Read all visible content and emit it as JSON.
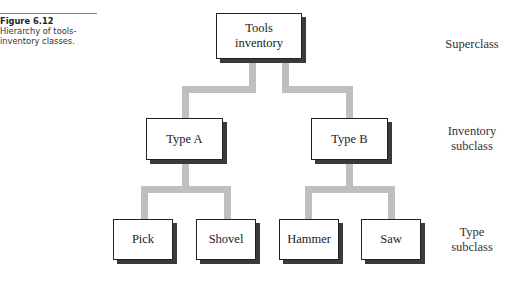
{
  "caption": {
    "figure_label": "Figure 6.12",
    "text_line1": "Hierarchy of tools-",
    "text_line2": "inventory classes."
  },
  "nodes": {
    "root": {
      "label_line1": "Tools",
      "label_line2": "inventory"
    },
    "type_a": {
      "label": "Type A"
    },
    "type_b": {
      "label": "Type B"
    },
    "pick": {
      "label": "Pick"
    },
    "shovel": {
      "label": "Shovel"
    },
    "hammer": {
      "label": "Hammer"
    },
    "saw": {
      "label": "Saw"
    }
  },
  "levels": {
    "superclass": {
      "line1": "Superclass"
    },
    "inventory_subclass": {
      "line1": "Inventory",
      "line2": "subclass"
    },
    "type_subclass": {
      "line1": "Type",
      "line2": "subclass"
    }
  },
  "colors": {
    "connector": "#bfbfbf",
    "box_border": "#222222",
    "box_shadow": "#3a3a3a"
  }
}
